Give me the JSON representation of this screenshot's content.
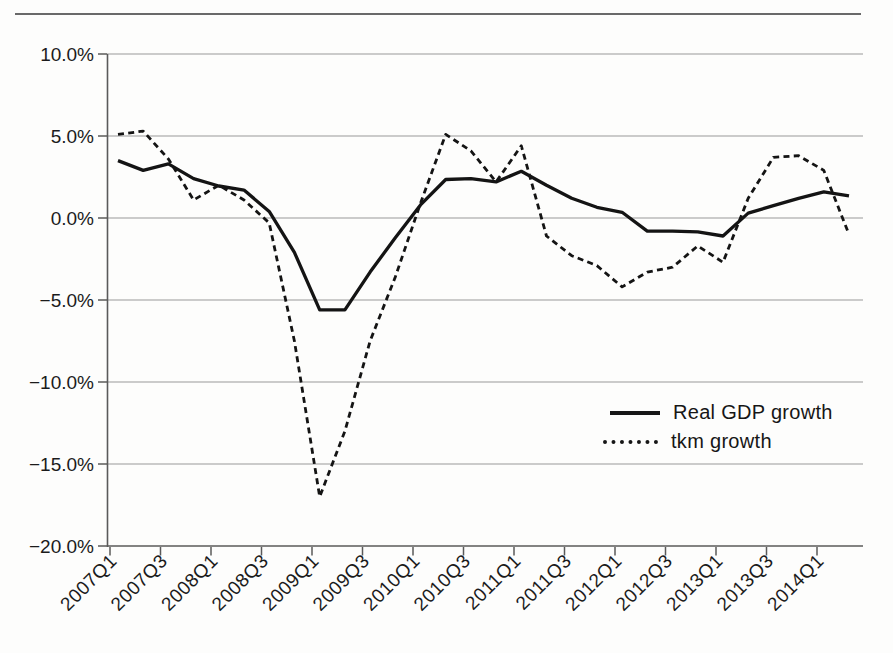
{
  "figure": {
    "background": "#fdfdfc",
    "line_color": "#141414",
    "grid_color": "#8f8f8f",
    "axis_color": "#5a5a5a",
    "text_color": "#1b1b1b"
  },
  "legend": {
    "position": "center-right",
    "items": [
      {
        "label": "Real GDP growth",
        "style": "solid"
      },
      {
        "label": "tkm growth",
        "style": "dashed"
      }
    ]
  },
  "chart_data": {
    "type": "line",
    "title": "",
    "xlabel": "",
    "ylabel": "",
    "grid": "horizontal",
    "ylim": [
      -20,
      10
    ],
    "y_ticks": [
      "10.0%",
      "5.0%",
      "0.0%",
      "−5.0%",
      "−10.0%",
      "−15.0%",
      "−20.0%"
    ],
    "x": [
      "2007Q1",
      "2007Q2",
      "2007Q3",
      "2007Q4",
      "2008Q1",
      "2008Q2",
      "2008Q3",
      "2008Q4",
      "2009Q1",
      "2009Q2",
      "2009Q3",
      "2009Q4",
      "2010Q1",
      "2010Q2",
      "2010Q3",
      "2010Q4",
      "2011Q1",
      "2011Q2",
      "2011Q3",
      "2011Q4",
      "2012Q1",
      "2012Q2",
      "2012Q3",
      "2012Q4",
      "2013Q1",
      "2013Q2",
      "2013Q3",
      "2013Q4",
      "2014Q1",
      "2014Q2"
    ],
    "x_tick_labels": [
      "2007Q1",
      "2007Q3",
      "2008Q1",
      "2008Q3",
      "2009Q1",
      "2009Q3",
      "2010Q1",
      "2010Q3",
      "2011Q1",
      "2011Q3",
      "2012Q1",
      "2012Q3",
      "2013Q1",
      "2013Q3",
      "2014Q1"
    ],
    "series": [
      {
        "name": "Real GDP growth",
        "style": "solid",
        "unit": "%",
        "values": [
          3.5,
          2.9,
          3.3,
          2.4,
          1.95,
          1.7,
          0.4,
          -2.1,
          -5.6,
          -5.6,
          -3.3,
          -1.2,
          0.8,
          2.35,
          2.4,
          2.2,
          2.85,
          2.0,
          1.2,
          0.65,
          0.35,
          -0.8,
          -0.8,
          -0.85,
          -1.1,
          0.3,
          0.75,
          1.2,
          1.6,
          1.35
        ]
      },
      {
        "name": "tkm growth",
        "style": "dashed",
        "unit": "%",
        "values": [
          5.1,
          5.3,
          3.6,
          1.1,
          2.0,
          1.1,
          -0.3,
          -7.5,
          -17.0,
          -13.0,
          -7.5,
          -3.6,
          0.9,
          5.1,
          4.1,
          2.2,
          4.4,
          -1.1,
          -2.3,
          -2.9,
          -4.2,
          -3.3,
          -3.0,
          -1.7,
          -2.7,
          1.2,
          3.7,
          3.8,
          2.9,
          -1.0
        ]
      }
    ]
  }
}
